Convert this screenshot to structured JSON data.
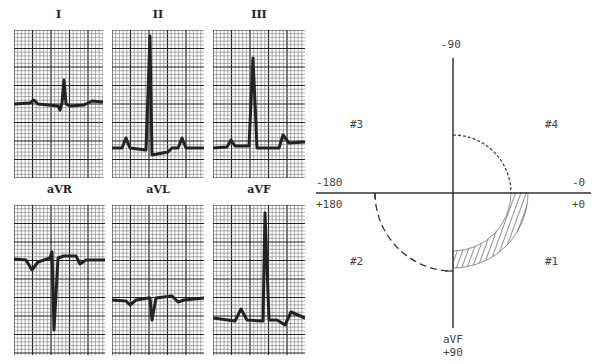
{
  "leads": [
    {
      "id": "I",
      "label": "I",
      "x": 14,
      "y": 30,
      "w": 89,
      "h": 148,
      "baseline": 104,
      "trace": "M0,104 L16,103 L20,100 L24,104 L44,106 L46,110 L48,103 L50,80 L52,104 L56,106 L70,105 L78,101 L89,102"
    },
    {
      "id": "II",
      "label": "II",
      "x": 112,
      "y": 30,
      "w": 92,
      "h": 148,
      "baseline": 148,
      "trace": "M0,148 L10,148 L14,138 L18,148 L34,150 L38,36 L40,155 L56,152 L60,148 L66,148 L70,138 L74,148 L92,148"
    },
    {
      "id": "III",
      "label": "III",
      "x": 213,
      "y": 30,
      "w": 92,
      "h": 148,
      "baseline": 148,
      "trace": "M0,148 L14,147 L18,140 L22,146 L36,146 L40,58 L44,148 L62,148 L66,148 L70,135 L76,143 L92,142"
    },
    {
      "id": "aVR",
      "label": "aVR",
      "x": 14,
      "y": 205,
      "w": 91,
      "h": 150,
      "baseline": 259,
      "trace": "M0,259 L12,260 L18,270 L24,262 L36,258 L38,252 L40,330 L44,258 L50,256 L62,256 L66,264 L72,260 L91,260"
    },
    {
      "id": "aVL",
      "label": "aVL",
      "x": 112,
      "y": 205,
      "w": 92,
      "h": 150,
      "baseline": 302,
      "trace": "M0,300 L14,301 L18,305 L24,300 L36,298 L38,298 L40,320 L44,298 L60,296 L66,302 L72,300 L92,298"
    },
    {
      "id": "aVF",
      "label": "aVF",
      "x": 213,
      "y": 205,
      "w": 92,
      "h": 150,
      "baseline": 320,
      "trace": "M0,318 L22,321 L28,309 L34,320 L50,321 L52,213 L56,320 L64,320 L72,325 L78,312 L92,318"
    }
  ],
  "axis_diagram": {
    "center": {
      "x": 453,
      "y": 193
    },
    "labels": {
      "top": "-90",
      "left_upper": "-180",
      "left_lower": "+180",
      "right_upper": "-0",
      "right_lower": "+0",
      "bottom_lead": "aVF",
      "bottom": "+90",
      "q1": "#1",
      "q2": "#2",
      "q3": "#3",
      "q4": "#4"
    },
    "quadrant_colors": {
      "line": "#333333",
      "hatch": "#444444"
    }
  }
}
